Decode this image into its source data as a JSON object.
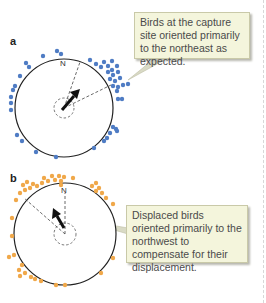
{
  "panels": [
    {
      "label": "a",
      "north_label": "N",
      "callout": "Birds at the capture site oriented primarily to the northeast as expected.",
      "dot_color": "#4f7cc4",
      "mean_direction": "northeast"
    },
    {
      "label": "b",
      "north_label": "N",
      "callout": "Displaced birds oriented primarily to the northwest to compensate for their displacement.",
      "dot_color": "#f0a84a",
      "mean_direction": "northwest"
    }
  ]
}
